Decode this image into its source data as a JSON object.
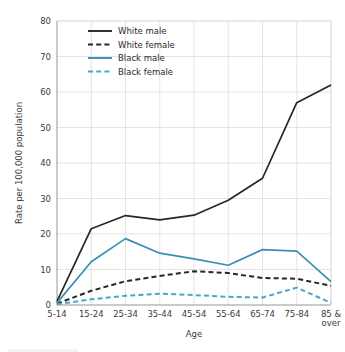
{
  "chart_data": {
    "type": "line",
    "title": "",
    "xlabel": "Age",
    "ylabel": "Rate per 100,000 population",
    "categories": [
      "5-14",
      "15-24",
      "25-34",
      "35-44",
      "45-54",
      "55-64",
      "65-74",
      "75-84",
      "85 & over"
    ],
    "ylim": [
      0,
      80
    ],
    "yticks": [
      0,
      10,
      20,
      30,
      40,
      50,
      60,
      70,
      80
    ],
    "grid": true,
    "legend_position": "top-center",
    "series": [
      {
        "name": "White male",
        "color": "#262626",
        "style": "solid",
        "values": [
          1.0,
          21.5,
          25.2,
          24.0,
          25.3,
          29.5,
          35.7,
          57.0,
          62.0
        ]
      },
      {
        "name": "White female",
        "color": "#262626",
        "style": "dashed",
        "values": [
          0.4,
          4.0,
          6.7,
          8.2,
          9.5,
          9.0,
          7.6,
          7.4,
          5.4
        ]
      },
      {
        "name": "Black male",
        "color": "#3b8fb5",
        "style": "solid",
        "values": [
          0.6,
          12.2,
          18.7,
          14.6,
          13.0,
          11.2,
          15.6,
          15.2,
          6.6
        ]
      },
      {
        "name": "Black female",
        "color": "#4ba6c8",
        "style": "dashed",
        "values": [
          0.2,
          1.6,
          2.6,
          3.2,
          2.8,
          2.3,
          2.1,
          4.9,
          0.6
        ]
      }
    ]
  },
  "axes": {
    "y_tick_labels": [
      "0",
      "10",
      "20",
      "30",
      "40",
      "50",
      "60",
      "70",
      "80"
    ],
    "x_tick_labels": [
      "5-14",
      "15-24",
      "25-34",
      "35-44",
      "45-54",
      "55-64",
      "65-74",
      "75-84",
      "85 &|over"
    ],
    "y_title": "Rate per 100,000 population",
    "x_title": "Age"
  },
  "legend": {
    "items": [
      {
        "label": "White male"
      },
      {
        "label": "White female"
      },
      {
        "label": "Black male"
      },
      {
        "label": "Black female"
      }
    ]
  }
}
